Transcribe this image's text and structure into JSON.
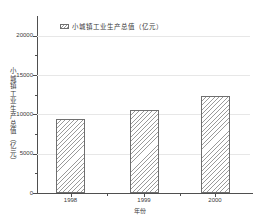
{
  "chart_data": {
    "type": "bar",
    "categories": [
      "1998",
      "1999",
      "2000"
    ],
    "values": [
      9400,
      10600,
      12300
    ],
    "series_name": "小城镇工业生产总值（亿元）",
    "legend": [
      "小城镇工业生产总值（亿元）"
    ],
    "title": "",
    "xlabel": "年份",
    "ylabel": "小城镇工业生产总值（亿元）",
    "ylim": [
      0,
      22500
    ],
    "yticks": [
      0,
      5000,
      10000,
      15000,
      20000
    ],
    "y_minor_ticks": [
      2500,
      7500,
      12500,
      17500
    ],
    "grid": "horizontal-major",
    "legend_position": "top-left",
    "bar_fill": "white-with-diagonal-hatch"
  },
  "colors": {
    "background": "#ffffff",
    "axis": "#4f4f4f",
    "gridline": "#e7e7e7",
    "text": "#3a3a3a",
    "bar_border": "#6f6f6f",
    "bar_hatch": "#9a9a9a"
  }
}
